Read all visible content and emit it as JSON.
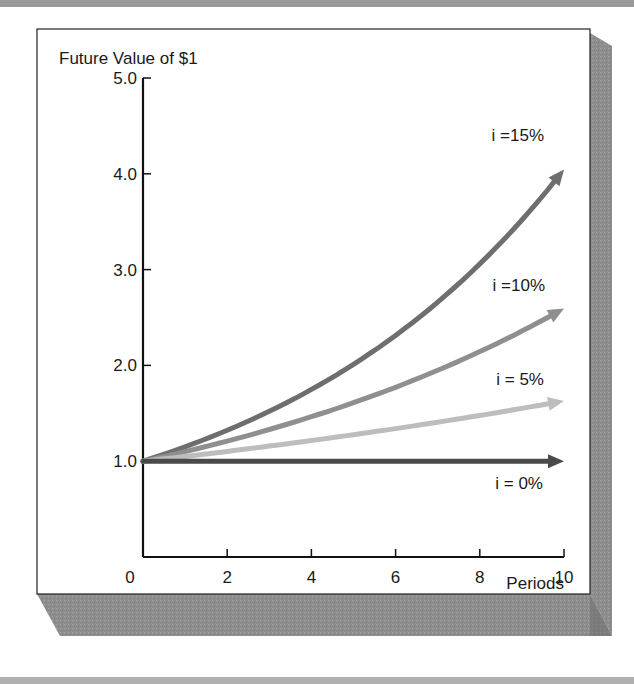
{
  "chart_data": {
    "type": "line",
    "title": "Future Value of $1",
    "xlabel": "Periods",
    "ylabel": "Future Value of $1",
    "xlim": [
      0,
      10
    ],
    "ylim": [
      0,
      5.0
    ],
    "x_ticks": [
      {
        "value": 0,
        "label": "0"
      },
      {
        "value": 2,
        "label": "2"
      },
      {
        "value": 4,
        "label": "4"
      },
      {
        "value": 6,
        "label": "6"
      },
      {
        "value": 8,
        "label": "8"
      },
      {
        "value": 10,
        "label": "10"
      }
    ],
    "y_ticks": [
      {
        "value": 1.0,
        "label": "1.0"
      },
      {
        "value": 2.0,
        "label": "2.0"
      },
      {
        "value": 3.0,
        "label": "3.0"
      },
      {
        "value": 4.0,
        "label": "4.0"
      },
      {
        "value": 5.0,
        "label": "5.0"
      }
    ],
    "grid": false,
    "legend": "inline labels at right end of each curve",
    "x": [
      0,
      1,
      2,
      3,
      4,
      5,
      6,
      7,
      8,
      9,
      10
    ],
    "series": [
      {
        "name": "i =15%",
        "rate": 0.15,
        "color": "#6e6e6e",
        "values": [
          1.0,
          1.15,
          1.32,
          1.52,
          1.75,
          2.01,
          2.31,
          2.66,
          3.06,
          3.52,
          4.05
        ]
      },
      {
        "name": "i =10%",
        "rate": 0.1,
        "color": "#8f8f8f",
        "values": [
          1.0,
          1.1,
          1.21,
          1.33,
          1.46,
          1.61,
          1.77,
          1.95,
          2.14,
          2.36,
          2.59
        ]
      },
      {
        "name": "i = 5%",
        "rate": 0.05,
        "color": "#bdbdbd",
        "values": [
          1.0,
          1.05,
          1.1,
          1.16,
          1.22,
          1.28,
          1.34,
          1.41,
          1.48,
          1.55,
          1.63
        ]
      },
      {
        "name": "i = 0%",
        "rate": 0.0,
        "color": "#4a4a4a",
        "values": [
          1.0,
          1.0,
          1.0,
          1.0,
          1.0,
          1.0,
          1.0,
          1.0,
          1.0,
          1.0,
          1.0
        ]
      }
    ]
  },
  "colors": {
    "frame_shadow": "#8c8c8c",
    "frame_border": "#222222",
    "axis": "#111111",
    "page_band": "#a0a0a0"
  }
}
